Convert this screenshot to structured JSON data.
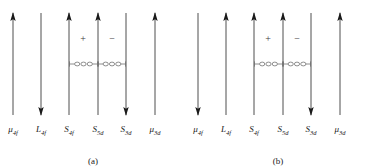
{
  "figure": {
    "type": "spin-moment-coupling-diagram",
    "panels": [
      {
        "id": "a",
        "caption": "(a)",
        "vectors": [
          {
            "name": "mu-4f",
            "label_base": "μ",
            "label_sub": "4f",
            "x": 13,
            "direction": "up",
            "length": 104
          },
          {
            "name": "L-4f",
            "label_base": "L",
            "label_sub": "4f",
            "x": 41,
            "direction": "down",
            "length": 104
          },
          {
            "name": "S-4f",
            "label_base": "S",
            "label_sub": "4f",
            "x": 69,
            "direction": "up",
            "length": 104
          },
          {
            "name": "S-5d",
            "label_base": "S",
            "label_sub": "5d",
            "x": 98,
            "direction": "up",
            "length": 104
          },
          {
            "name": "S-3d",
            "label_base": "S",
            "label_sub": "3d",
            "x": 126,
            "direction": "down",
            "length": 104
          },
          {
            "name": "mu-3d",
            "label_base": "μ",
            "label_sub": "3d",
            "x": 155,
            "direction": "up",
            "length": 104
          }
        ],
        "signs": [
          {
            "name": "plus-sign",
            "symbol": "+",
            "x": 83,
            "y": 33
          },
          {
            "name": "minus-sign",
            "symbol": "−",
            "x": 112,
            "y": 33
          }
        ],
        "couplers": [
          {
            "name": "coupling-4f-5d",
            "from_x": 69,
            "to_x": 98,
            "y": 64
          },
          {
            "name": "coupling-5d-3d",
            "from_x": 98,
            "to_x": 126,
            "y": 64
          }
        ]
      },
      {
        "id": "b",
        "caption": "(b)",
        "vectors": [
          {
            "name": "mu-4f",
            "label_base": "μ",
            "label_sub": "4f",
            "x": 13,
            "direction": "down",
            "length": 104
          },
          {
            "name": "L-4f",
            "label_base": "L",
            "label_sub": "4f",
            "x": 41,
            "direction": "up",
            "length": 104
          },
          {
            "name": "S-4f",
            "label_base": "S",
            "label_sub": "4f",
            "x": 69,
            "direction": "up",
            "length": 104
          },
          {
            "name": "S-5d",
            "label_base": "S",
            "label_sub": "5d",
            "x": 98,
            "direction": "up",
            "length": 104
          },
          {
            "name": "S-3d",
            "label_base": "S",
            "label_sub": "3d",
            "x": 126,
            "direction": "down",
            "length": 104
          },
          {
            "name": "mu-3d",
            "label_base": "μ",
            "label_sub": "3d",
            "x": 155,
            "direction": "up",
            "length": 104
          }
        ],
        "signs": [
          {
            "name": "plus-sign",
            "symbol": "+",
            "x": 83,
            "y": 33
          },
          {
            "name": "minus-sign",
            "symbol": "−",
            "x": 112,
            "y": 33
          }
        ],
        "couplers": [
          {
            "name": "coupling-4f-5d",
            "from_x": 69,
            "to_x": 98,
            "y": 64
          },
          {
            "name": "coupling-5d-3d",
            "from_x": 98,
            "to_x": 126,
            "y": 64
          }
        ]
      }
    ],
    "geometry": {
      "arrow_top": 12,
      "arrow_bottom": 116,
      "label_y": 124
    },
    "colors": {
      "line": "#3a3a3a",
      "arrowhead": "#1a1a1a",
      "text": "#1a1a1a",
      "coupler": "#6a6a6a"
    }
  }
}
